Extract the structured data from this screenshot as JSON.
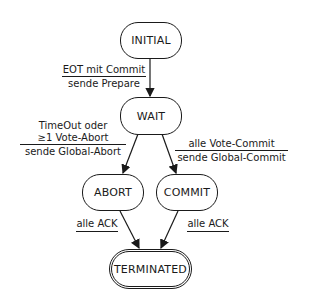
{
  "diagram": {
    "type": "state-machine",
    "nodes": {
      "initial": {
        "label": "INITIAL"
      },
      "wait": {
        "label": "WAIT"
      },
      "abort": {
        "label": "ABORT"
      },
      "commit": {
        "label": "COMMIT"
      },
      "terminated": {
        "label": "TERMINATED",
        "final": true
      }
    },
    "edges": {
      "initial_wait": {
        "condition": "EOT mit Commit",
        "action": "sende Prepare"
      },
      "wait_abort": {
        "condition_line1": "TimeOut oder",
        "condition_line2": "≥1 Vote-Abort",
        "action": "sende Global-Abort"
      },
      "wait_commit": {
        "condition": "alle Vote-Commit",
        "action": "sende Global-Commit"
      },
      "abort_terminated": {
        "condition": "alle ACK"
      },
      "commit_terminated": {
        "condition": "alle ACK"
      }
    }
  }
}
